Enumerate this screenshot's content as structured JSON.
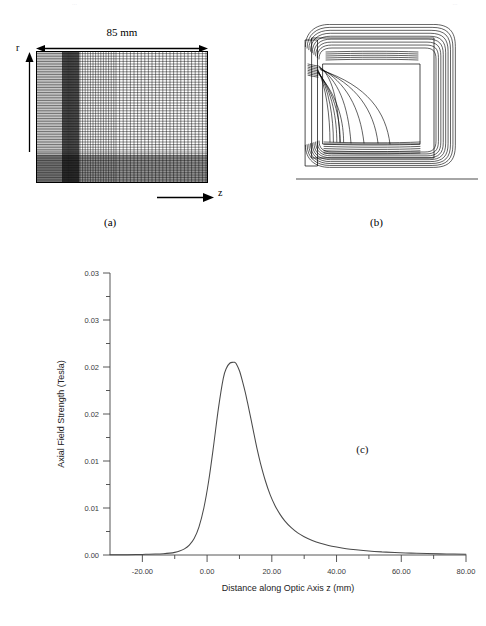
{
  "page": {
    "header_left_artifact": "…",
    "header_right_artifact": "…"
  },
  "panel_a": {
    "tag": "(a)",
    "dimension_label": "85 mm",
    "r_axis_label": "r",
    "z_axis_label": "z",
    "description": "finite-element mesh of rotationally symmetric magnetic lens, dense vertical coil band at left and horizontal yoke band at bottom"
  },
  "panel_b": {
    "tag": "(b)",
    "description": "magnetic flux line contour plot of the lens cross-section above the optic axis"
  },
  "panel_c": {
    "tag": "(c)",
    "chart_data": {
      "type": "line",
      "title": "",
      "xlabel": "Distance along Optic Axis z (mm)",
      "ylabel": "Axial Field Strength (Tesla)",
      "xlim": [
        -30.0,
        80.0
      ],
      "ylim": [
        0.0,
        0.03
      ],
      "grid": false,
      "legend": null,
      "xticks": [
        -20.0,
        0.0,
        20.0,
        40.0,
        60.0,
        80.0
      ],
      "xtick_labels": [
        "-20.00",
        "0.00",
        "20.00",
        "40.00",
        "60.00",
        "80.00"
      ],
      "xminor_step": 10.0,
      "yticks": [
        0.0,
        0.005,
        0.01,
        0.015,
        0.02,
        0.025,
        0.03
      ],
      "ytick_labels": [
        "0.00",
        "0.01",
        "0.01",
        "0.02",
        "0.02",
        "0.03"
      ],
      "ytick_label_values": [
        0.0,
        0.005,
        0.01,
        0.015,
        0.02,
        0.025,
        0.03
      ],
      "peak_x": 8.5,
      "peak_y": 0.0205,
      "series": [
        {
          "name": "Axial field Bz",
          "x": [
            -30.0,
            -26.0,
            -22.0,
            -19.0,
            -16.0,
            -13.5,
            -11.5,
            -10.0,
            -8.5,
            -7.0,
            -5.5,
            -4.0,
            -2.5,
            -1.0,
            0.5,
            2.0,
            3.5,
            5.0,
            6.0,
            7.0,
            8.0,
            8.5,
            9.0,
            10.0,
            11.0,
            11.8,
            12.5,
            13.5,
            14.5,
            15.5,
            16.5,
            18.0,
            19.5,
            21.0,
            22.5,
            24.0,
            26.0,
            28.0,
            30.0,
            32.5,
            35.0,
            37.5,
            40.0,
            43.0,
            46.0,
            50.0,
            54.0,
            58.0,
            63.0,
            68.0,
            74.0,
            80.0
          ],
          "y": [
            2e-05,
            3e-05,
            5e-05,
            7e-05,
            0.0001,
            0.00014,
            0.0002,
            0.00028,
            0.00042,
            0.00065,
            0.00105,
            0.00175,
            0.003,
            0.005,
            0.0079,
            0.0116,
            0.0156,
            0.0188,
            0.0199,
            0.0204,
            0.0205,
            0.0205,
            0.02035,
            0.0196,
            0.0184,
            0.0173,
            0.0162,
            0.01455,
            0.01285,
            0.0112,
            0.00975,
            0.0079,
            0.0064,
            0.00525,
            0.00435,
            0.00363,
            0.0029,
            0.00235,
            0.00195,
            0.00155,
            0.00124,
            0.00101,
            0.00084,
            0.00067,
            0.00055,
            0.00042,
            0.00033,
            0.00026,
            0.0002,
            0.00015,
            0.00011,
            8e-05
          ]
        }
      ]
    }
  }
}
